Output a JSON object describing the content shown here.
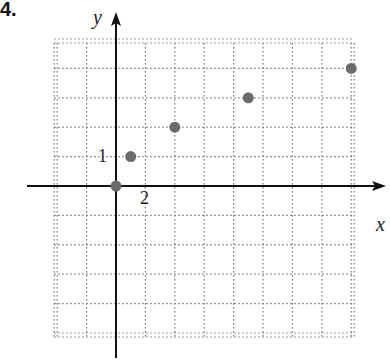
{
  "problem_number": "4.",
  "chart_data": {
    "type": "scatter",
    "title": "",
    "xlabel": "x",
    "ylabel": "y",
    "x_tick_label": {
      "value": 2,
      "text": "2"
    },
    "y_tick_label": {
      "value": 1,
      "text": "1"
    },
    "grid": true,
    "grid_x_step": 2,
    "grid_y_step": 1,
    "xlim": [
      -4,
      16
    ],
    "ylim": [
      -5,
      5
    ],
    "points": [
      {
        "x": 0,
        "y": 0
      },
      {
        "x": 1,
        "y": 1
      },
      {
        "x": 4,
        "y": 2
      },
      {
        "x": 9,
        "y": 3
      },
      {
        "x": 16,
        "y": 4
      }
    ],
    "point_color": "#6b6b6b"
  }
}
